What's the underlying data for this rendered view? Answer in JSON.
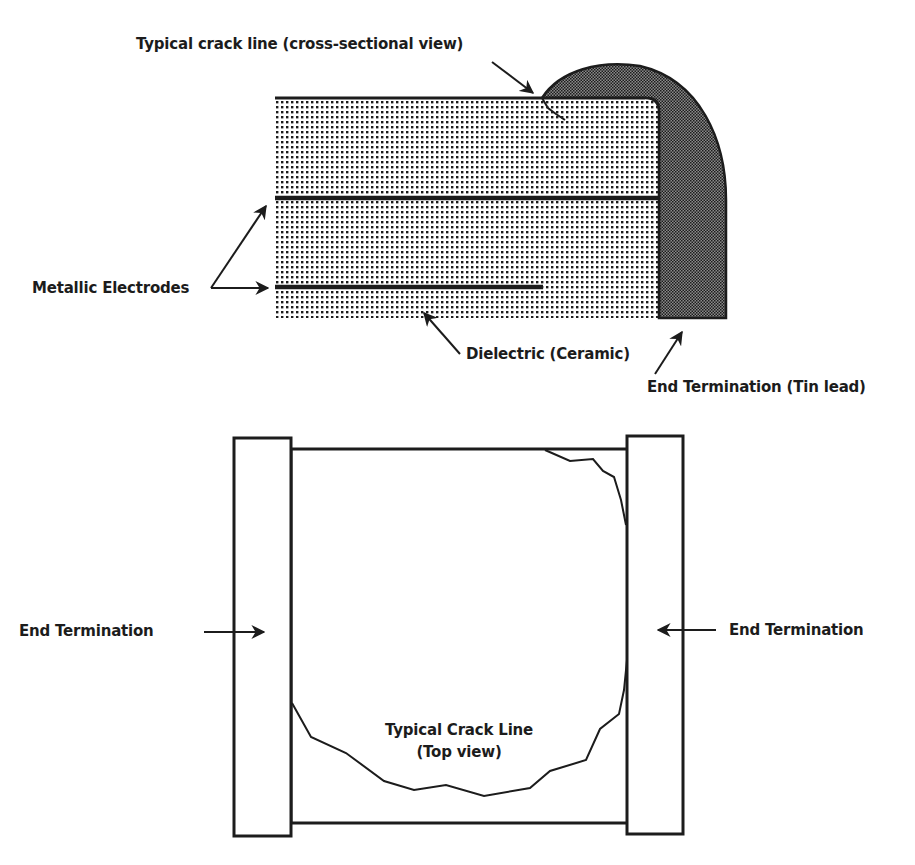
{
  "cross_section": {
    "title": "Capacitor cross-sectional view",
    "labels": {
      "crack_line": "Typical crack line (cross-sectional view)",
      "electrodes": "Metallic Electrodes",
      "dielectric": "Dielectric (Ceramic)",
      "end_termination": "End Termination (Tin lead)"
    }
  },
  "top_view": {
    "labels": {
      "end_termination_left": "End Termination",
      "end_termination_right": "End Termination",
      "crack_line_line1": "Typical Crack Line",
      "crack_line_line2": "(Top view)"
    }
  },
  "colors": {
    "ink": "#1c1c1c",
    "background": "#ffffff"
  }
}
